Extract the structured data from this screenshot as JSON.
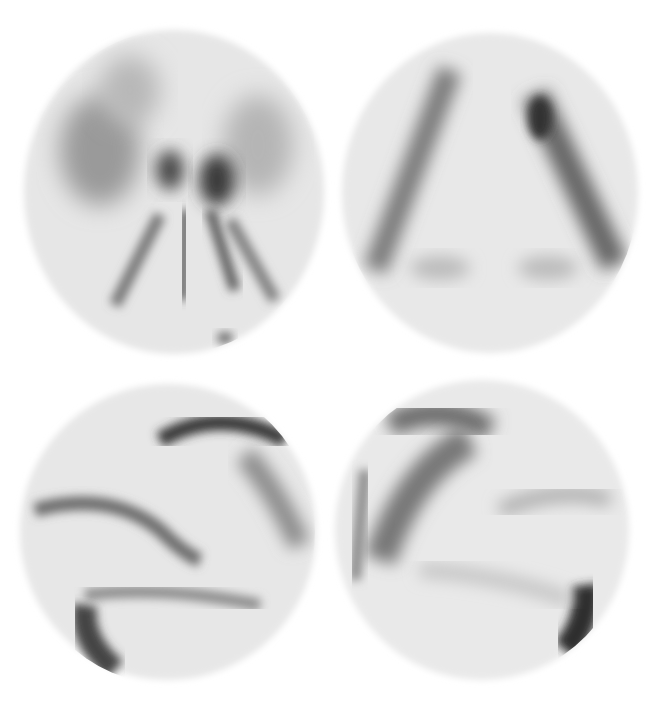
{
  "figure": {
    "layout": "2x2 grid of grayscale scintigraphy scans",
    "background": "#ffffff",
    "panels": [
      {
        "id": "top-left",
        "view": "axial/dorsal view",
        "labels": [
          {
            "text": "cran",
            "x": 168,
            "y": 57,
            "tone": "dark"
          },
          {
            "text": "ts",
            "x": 190,
            "y": 170,
            "tone": "dark"
          },
          {
            "text": "spine",
            "x": 183,
            "y": 314,
            "tone": "dark"
          }
        ]
      },
      {
        "id": "top-right",
        "view": "ventral view",
        "labels": [
          {
            "text": "cran",
            "x": 490,
            "y": 61,
            "tone": "dark"
          },
          {
            "text": "spine",
            "x": 490,
            "y": 238,
            "tone": "dark"
          },
          {
            "text": "ti",
            "x": 441,
            "y": 265,
            "tone": "dark"
          },
          {
            "text": "ti",
            "x": 546,
            "y": 265,
            "tone": "dark"
          }
        ]
      },
      {
        "id": "bottom-left",
        "view": "lateral view (left)",
        "labels": [
          {
            "text": "cran",
            "x": 64,
            "y": 450,
            "tone": "dark"
          },
          {
            "text": "ts",
            "x": 201,
            "y": 440,
            "tone": "light"
          },
          {
            "text": "tc",
            "x": 100,
            "y": 636,
            "tone": "light"
          }
        ]
      },
      {
        "id": "bottom-right",
        "view": "lateral view (right)",
        "labels": [
          {
            "text": "cran",
            "x": 571,
            "y": 450,
            "tone": "dark"
          },
          {
            "text": "ts",
            "x": 476,
            "y": 428,
            "tone": "light"
          },
          {
            "text": "tc",
            "x": 582,
            "y": 621,
            "tone": "light"
          }
        ]
      }
    ],
    "colors": {
      "label_dark": "#111111",
      "label_light": "#ffffff",
      "tracer_dark": "#2a2a2a",
      "tracer_mid": "#8a8a8a",
      "tracer_light": "#e4e4e4"
    }
  }
}
